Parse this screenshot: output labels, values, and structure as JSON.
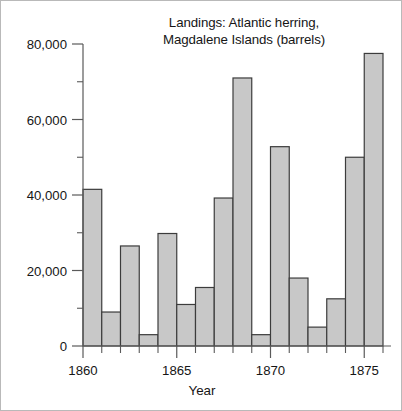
{
  "chart_data": {
    "type": "bar",
    "title": "Landings: Atlantic herring,\nMagdalene Islands (barrels)",
    "title_line1": "Landings: Atlantic herring,",
    "title_line2": "Magdalene Islands (barrels)",
    "xlabel": "Year",
    "ylabel": "",
    "categories": [
      1860,
      1861,
      1862,
      1863,
      1864,
      1865,
      1866,
      1867,
      1868,
      1869,
      1870,
      1871,
      1872,
      1873,
      1874,
      1875
    ],
    "values": [
      41500,
      9000,
      26500,
      3000,
      29800,
      11000,
      15500,
      39200,
      71000,
      3000,
      52800,
      18000,
      5000,
      12500,
      50000,
      77500
    ],
    "xlim": [
      1860,
      1876
    ],
    "ylim": [
      0,
      80000
    ],
    "ytick_values": [
      0,
      20000,
      40000,
      60000,
      80000
    ],
    "ytick_labels": [
      "0",
      "20,000",
      "40,000",
      "60,000",
      "80,000"
    ],
    "yminor_tick_values": [
      10000,
      30000,
      50000,
      70000
    ],
    "xtick_values": [
      1860,
      1865,
      1870,
      1875
    ],
    "xtick_labels": [
      "1860",
      "1865",
      "1870",
      "1875"
    ],
    "xminor_tick_values": [
      1861,
      1862,
      1863,
      1864,
      1866,
      1867,
      1868,
      1869,
      1871,
      1872,
      1873,
      1874,
      1876
    ],
    "grid": false,
    "legend": null,
    "bar_fill_color": "#c8c8c8",
    "bar_edge_color": "#3c3c3c",
    "axis_color": "#5a5a5a",
    "text_color": "#161616",
    "background_color": "#ffffff"
  }
}
